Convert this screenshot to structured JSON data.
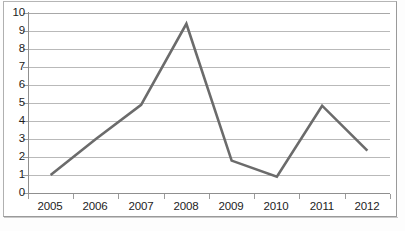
{
  "chart_data": {
    "type": "line",
    "title": "",
    "subtitle": "",
    "xlabel": "",
    "ylabel": "",
    "categories": [
      "2005",
      "2006",
      "2007",
      "2008",
      "2009",
      "2010",
      "2011",
      "2012"
    ],
    "values": [
      1.0,
      3.0,
      4.9,
      9.4,
      1.8,
      0.9,
      4.85,
      2.35
    ],
    "series": [
      {
        "name": "",
        "values": [
          1.0,
          3.0,
          4.9,
          9.4,
          1.8,
          0.9,
          4.85,
          2.35
        ]
      }
    ],
    "ylim": [
      0,
      10
    ],
    "ytick_labels": [
      "10",
      "9",
      "8",
      "7",
      "6",
      "5",
      "4",
      "3",
      "2",
      "1",
      "0"
    ],
    "ytick_values": [
      10,
      9,
      8,
      7,
      6,
      5,
      4,
      3,
      2,
      1,
      0
    ],
    "grid": "horizontal",
    "legend": "none",
    "line_color": "#6b6b6b",
    "gridline_color": "#b9b9b9",
    "axis_color": "#8f8f8f",
    "background_color": "#ffffff",
    "annotations": []
  },
  "caption": {
    "text": ""
  }
}
